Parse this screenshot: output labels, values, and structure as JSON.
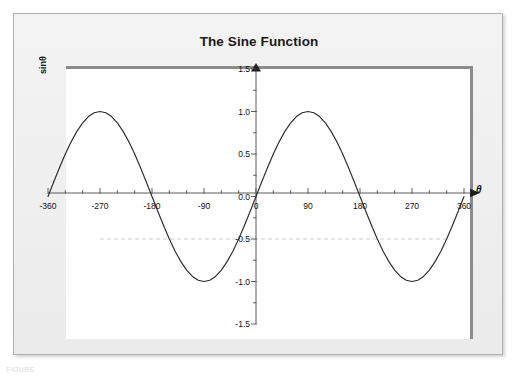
{
  "figure": {
    "title": "The Sine Function",
    "caption": "FIGURE"
  },
  "chart_data": {
    "type": "line",
    "title": "The Sine Function",
    "xlabel": "θ",
    "ylabel": "sinθ",
    "xlim": [
      -360,
      360
    ],
    "ylim": [
      -1.5,
      1.5
    ],
    "grid": false,
    "legend": null,
    "x_tick_labels": [
      "-360",
      "-270",
      "-180",
      "-90",
      "0",
      "90",
      "180",
      "270",
      "360"
    ],
    "x_ticks": [
      -360,
      -270,
      -180,
      -90,
      0,
      90,
      180,
      270,
      360
    ],
    "x_minor_tick_step": 30,
    "y_tick_labels": [
      "1.5",
      "1.0",
      "0.5",
      "0.0",
      "-0.5",
      "-1.0",
      "-1.5"
    ],
    "y_ticks": [
      1.5,
      1.0,
      0.5,
      0.0,
      -0.5,
      -1.0,
      -1.5
    ],
    "y_minor_tick_step": 0.25,
    "series": [
      {
        "name": "sinθ",
        "color": "#2b2b2b",
        "x": [
          -360,
          -350,
          -340,
          -330,
          -320,
          -310,
          -300,
          -290,
          -280,
          -270,
          -260,
          -250,
          -240,
          -230,
          -220,
          -210,
          -200,
          -190,
          -180,
          -170,
          -160,
          -150,
          -140,
          -130,
          -120,
          -110,
          -100,
          -90,
          -80,
          -70,
          -60,
          -50,
          -40,
          -30,
          -20,
          -10,
          0,
          10,
          20,
          30,
          40,
          50,
          60,
          70,
          80,
          90,
          100,
          110,
          120,
          130,
          140,
          150,
          160,
          170,
          180,
          190,
          200,
          210,
          220,
          230,
          240,
          250,
          260,
          270,
          280,
          290,
          300,
          310,
          320,
          330,
          340,
          350,
          360
        ],
        "values": [
          0.0,
          0.174,
          0.342,
          0.5,
          0.643,
          0.766,
          0.866,
          0.94,
          0.985,
          1.0,
          0.985,
          0.94,
          0.866,
          0.766,
          0.643,
          0.5,
          0.342,
          0.174,
          0.0,
          -0.174,
          -0.342,
          -0.5,
          -0.643,
          -0.766,
          -0.866,
          -0.94,
          -0.985,
          -1.0,
          -0.985,
          -0.94,
          -0.866,
          -0.766,
          -0.643,
          -0.5,
          -0.342,
          -0.174,
          0.0,
          0.174,
          0.342,
          0.5,
          0.643,
          0.766,
          0.866,
          0.94,
          0.985,
          1.0,
          0.985,
          0.94,
          0.866,
          0.766,
          0.643,
          0.5,
          0.342,
          0.174,
          0.0,
          -0.174,
          -0.342,
          -0.5,
          -0.643,
          -0.766,
          -0.866,
          -0.94,
          -0.985,
          -1.0,
          -0.985,
          -0.94,
          -0.866,
          -0.766,
          -0.643,
          -0.5,
          -0.342,
          -0.174,
          0.0
        ]
      }
    ],
    "annotations": [
      {
        "type": "hline",
        "name": "reference-line",
        "y": -0.5,
        "style": "dashed",
        "color": "#c9c9c9",
        "x_start": -270,
        "x_end": 330
      }
    ],
    "axis_style": {
      "x_axis_arrow": true,
      "y_axis_arrow": true,
      "axis_color": "#4a4a4a"
    }
  }
}
